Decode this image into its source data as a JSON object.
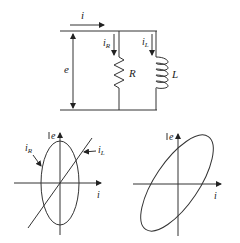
{
  "circuit": {
    "source_current_label": "i",
    "voltage_label": "e",
    "resistor_branch": {
      "current_label": "i",
      "current_sub": "R",
      "component_label": "R"
    },
    "inductor_branch": {
      "current_label": "i",
      "current_sub": "L",
      "component_label": "L"
    }
  },
  "plots": [
    {
      "id": "left",
      "y_axis_label": "e",
      "x_axis_label": "i",
      "curves": [
        {
          "name": "i_R",
          "label_main": "i",
          "label_sub": "R",
          "shape": "upright ellipse"
        },
        {
          "name": "i_L",
          "label_main": "i",
          "label_sub": "L",
          "shape": "diagonal line"
        }
      ]
    },
    {
      "id": "right",
      "y_axis_label": "e",
      "x_axis_label": "i",
      "curves": [
        {
          "name": "i",
          "shape": "tilted ellipse"
        }
      ]
    }
  ],
  "colors": {
    "line": "#333333",
    "background": "#ffffff"
  }
}
